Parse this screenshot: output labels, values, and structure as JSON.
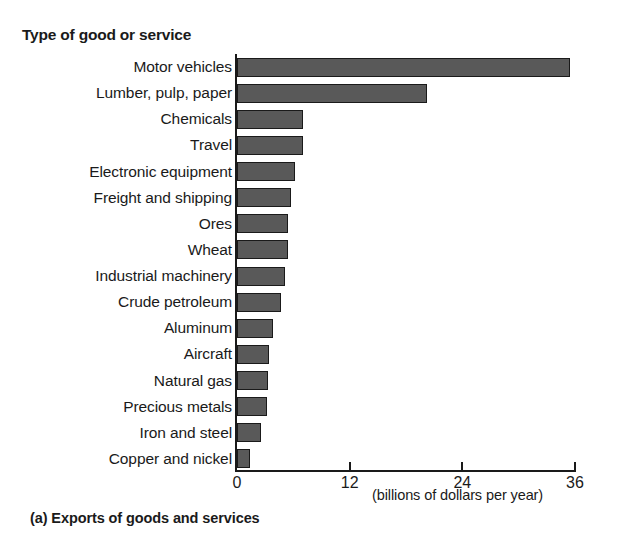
{
  "chart_data": {
    "type": "bar",
    "orientation": "horizontal",
    "title": "Type of good or service",
    "xlabel": "(billions of dollars per year)",
    "ylabel": "Type of good or service",
    "caption": "(a) Exports of goods and services",
    "xlim": [
      0,
      36
    ],
    "xticks": [
      0,
      12,
      24,
      36
    ],
    "xtick_labels": [
      "0",
      "12",
      "24",
      "36"
    ],
    "grid": false,
    "legend": null,
    "bar_color": "#595959",
    "bar_edge_color": "#1a1a1a",
    "categories": [
      "Motor vehicles",
      "Lumber, pulp, paper",
      "Chemicals",
      "Travel",
      "Electronic equipment",
      "Freight and shipping",
      "Ores",
      "Wheat",
      "Industrial machinery",
      "Crude petroleum",
      "Aluminum",
      "Aircraft",
      "Natural gas",
      "Precious metals",
      "Iron and steel",
      "Copper and nickel"
    ],
    "values": [
      35.5,
      20.2,
      7.0,
      7.0,
      6.2,
      5.7,
      5.4,
      5.4,
      5.1,
      4.7,
      3.8,
      3.4,
      3.3,
      3.2,
      2.6,
      1.4
    ]
  }
}
